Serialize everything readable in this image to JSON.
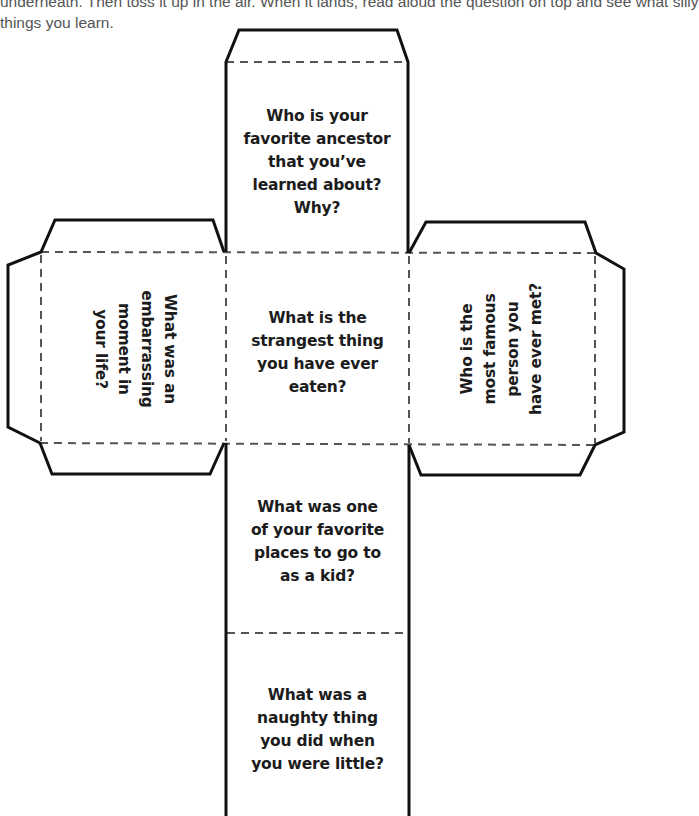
{
  "instructions": {
    "lines": [
      "underneath. Then toss it up in the air. When it lands, read aloud the question on top and see what silly",
      "things you learn."
    ]
  },
  "cube": {
    "colors": {
      "outline": "#111111",
      "fold_line": "#555555",
      "text": "#1c1c1c"
    },
    "faces": {
      "top": {
        "lines": [
          "Who is your",
          "favorite ancestor",
          "that you’ve",
          "learned about?",
          "Why?"
        ]
      },
      "left": {
        "orientation": "rotated 90deg clockwise",
        "lines": [
          "What was an",
          "embarrassing",
          "moment in",
          "your life?"
        ]
      },
      "center": {
        "lines": [
          "What is the",
          "strangest thing",
          "you have ever",
          "eaten?"
        ]
      },
      "right": {
        "orientation": "rotated 90deg counter-clockwise",
        "lines": [
          "Who is the",
          "most famous",
          "person you",
          "have ever met?"
        ]
      },
      "lower": {
        "lines": [
          "What was one",
          "of your favorite",
          "places to go to",
          "as a kid?"
        ]
      },
      "bottom": {
        "lines": [
          "What was a",
          "naughty thing",
          "you did when",
          "you were little?"
        ]
      }
    }
  }
}
